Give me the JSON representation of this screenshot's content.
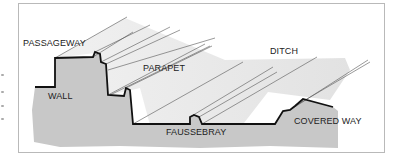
{
  "diagram": {
    "type": "fortification-cross-section",
    "labels": {
      "passageway": "PASSAGEWAY",
      "wall": "WALL",
      "parapet": "PARAPET",
      "ditch": "DITCH",
      "faussebray": "FAUSSEBRAY",
      "covered_way": "COVERED WAY"
    },
    "colors": {
      "ground": "#c8c8c8",
      "profile_line": "#111111",
      "slope_shade": "#e6e6e6",
      "hatch_line": "#555555",
      "frame": "#b9b9b9"
    }
  }
}
